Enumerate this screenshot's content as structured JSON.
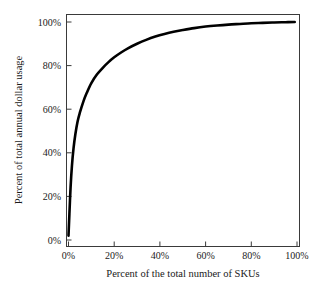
{
  "chart_data": {
    "type": "line",
    "title": "",
    "subtitle": "",
    "xlabel": "Percent of the total number of SKUs",
    "ylabel": "Percent of total annual dollar usage",
    "xlim": [
      0,
      100
    ],
    "ylim": [
      0,
      100
    ],
    "xticks": [
      0,
      20,
      40,
      60,
      80,
      100
    ],
    "yticks": [
      0,
      20,
      40,
      60,
      80,
      100
    ],
    "xtick_labels": [
      "0%",
      "20%",
      "40%",
      "60%",
      "80%",
      "100%"
    ],
    "ytick_labels": [
      "0%",
      "20%",
      "40%",
      "60%",
      "80%",
      "100%"
    ],
    "grid": false,
    "legend": null,
    "legend_position": "none",
    "series": [
      {
        "name": "Cumulative annual dollar usage",
        "color": "#000000",
        "line_width": 2.6,
        "x": [
          0.0,
          0.4,
          0.9,
          1.5,
          2.2,
          3.0,
          4.0,
          5.0,
          6.5,
          8.0,
          10.0,
          12.5,
          15.0,
          17.5,
          20.0,
          23.0,
          26.0,
          30.0,
          34.0,
          38.0,
          42.0,
          46.0,
          50.0,
          55.0,
          60.0,
          65.0,
          70.0,
          75.0,
          80.0,
          85.0,
          90.0,
          95.0,
          99.0
        ],
        "y": [
          2.0,
          12.0,
          24.0,
          34.0,
          42.0,
          48.5,
          54.5,
          58.5,
          63.5,
          67.5,
          72.0,
          76.0,
          79.0,
          81.6,
          83.8,
          86.0,
          87.9,
          90.0,
          91.8,
          93.3,
          94.5,
          95.5,
          96.3,
          97.2,
          97.9,
          98.4,
          98.8,
          99.1,
          99.4,
          99.6,
          99.8,
          99.9,
          100.0
        ]
      }
    ]
  }
}
